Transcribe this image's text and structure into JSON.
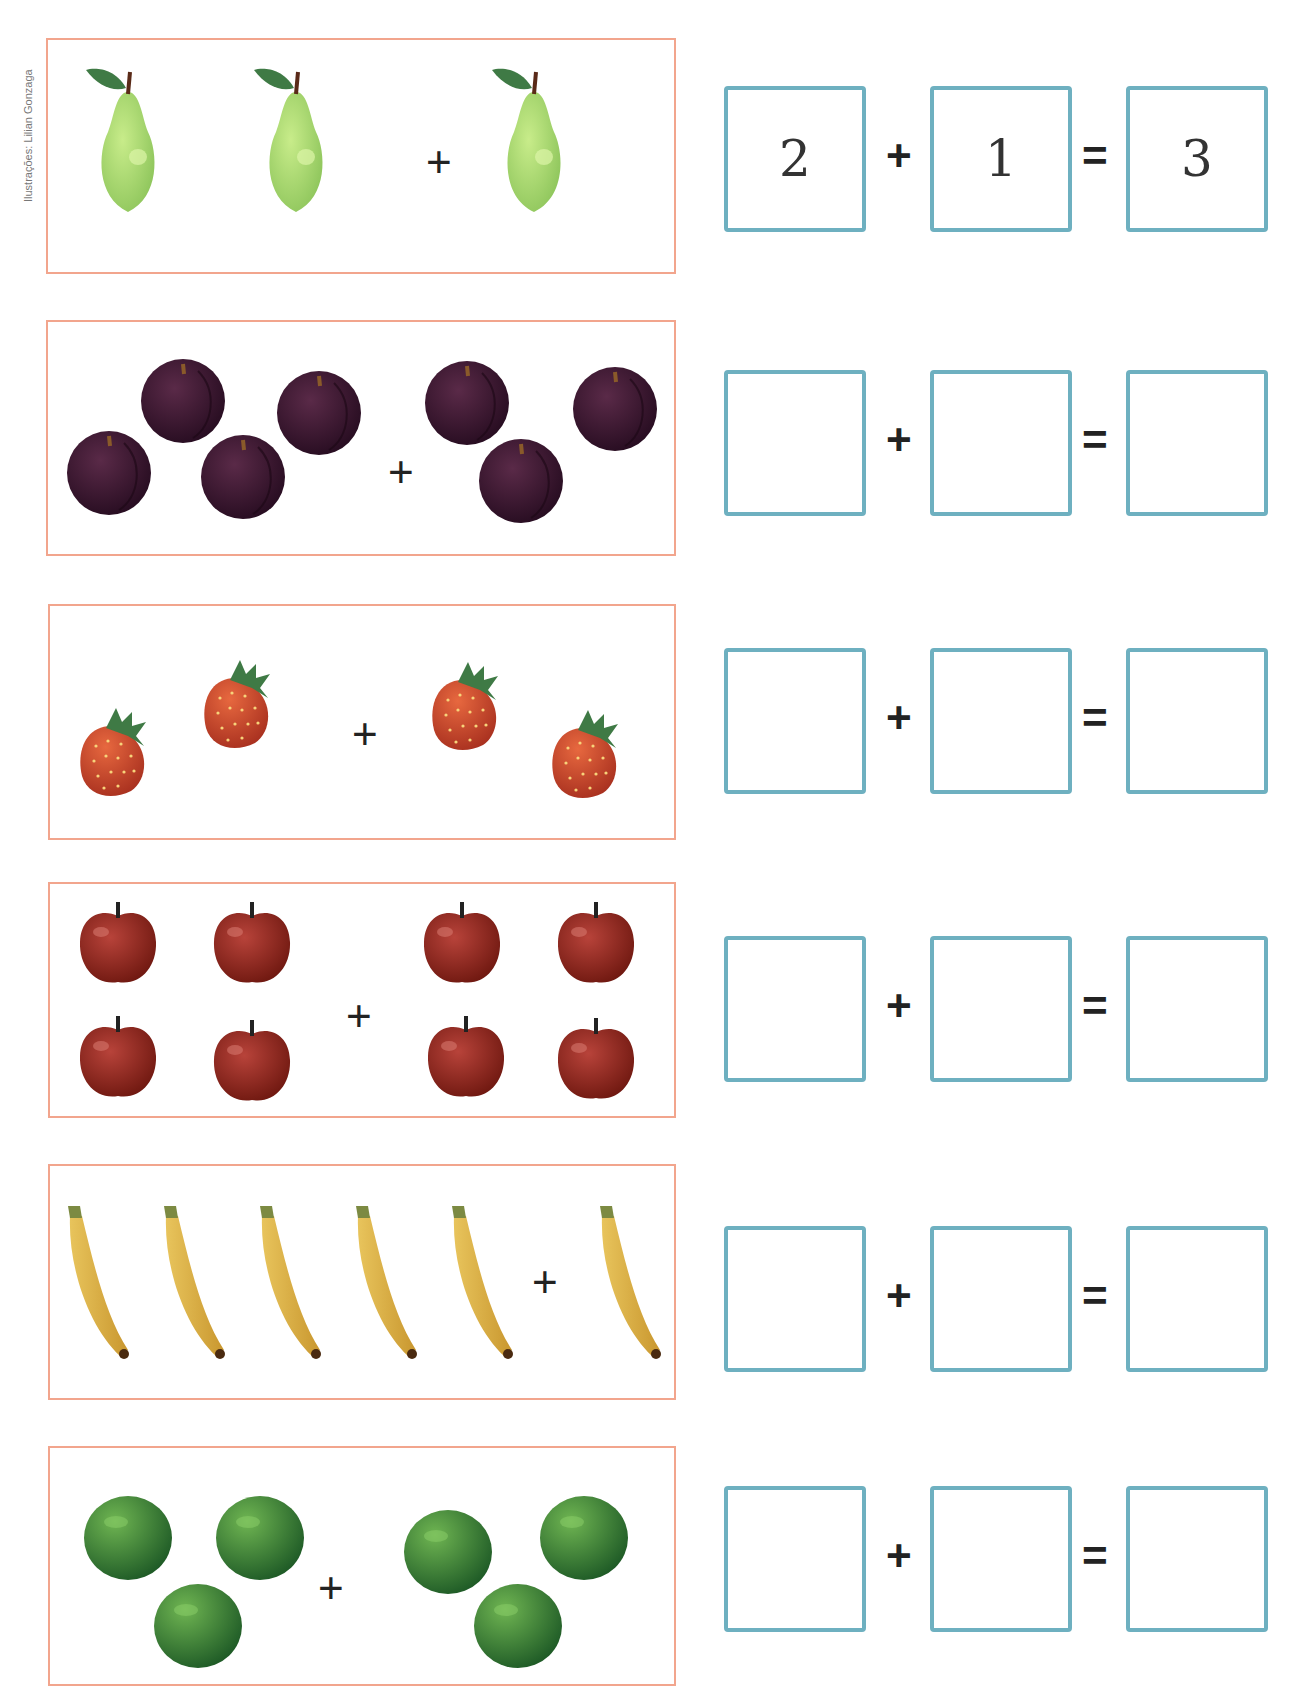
{
  "credit": "Ilustrações: Lilian Gonzaga",
  "accent": {
    "box_border": "#f2a58d",
    "answer_border": "#6eb0c0"
  },
  "exercises": [
    {
      "fruit": "pear",
      "left_count": 2,
      "right_count": 1,
      "plus": "+",
      "equals": "=",
      "answer": {
        "a": "2",
        "b": "1",
        "sum": "3"
      }
    },
    {
      "fruit": "plum",
      "left_count": 4,
      "right_count": 3,
      "plus": "+",
      "equals": "=",
      "answer": {
        "a": "",
        "b": "",
        "sum": ""
      }
    },
    {
      "fruit": "strawberry",
      "left_count": 2,
      "right_count": 2,
      "plus": "+",
      "equals": "=",
      "answer": {
        "a": "",
        "b": "",
        "sum": ""
      }
    },
    {
      "fruit": "apple",
      "left_count": 4,
      "right_count": 4,
      "plus": "+",
      "equals": "=",
      "answer": {
        "a": "",
        "b": "",
        "sum": ""
      }
    },
    {
      "fruit": "banana",
      "left_count": 5,
      "right_count": 1,
      "plus": "+",
      "equals": "=",
      "answer": {
        "a": "",
        "b": "",
        "sum": ""
      }
    },
    {
      "fruit": "lime",
      "left_count": 3,
      "right_count": 3,
      "plus": "+",
      "equals": "=",
      "answer": {
        "a": "",
        "b": "",
        "sum": ""
      }
    }
  ]
}
